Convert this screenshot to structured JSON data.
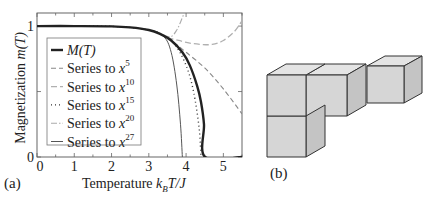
{
  "figure": {
    "panel_a_label": "(a)",
    "panel_b_label": "(b)"
  },
  "chart_data": [
    {
      "type": "line",
      "panel": "(a)",
      "title": "",
      "xlabel": "Temperature k_B T/J",
      "xlabel_parts": {
        "main": "Temperature ",
        "k": "k",
        "sub": "B",
        "rest": "T/J"
      },
      "ylabel": "Magnetization m(T)",
      "ylabel_parts": {
        "main": "Magnetization ",
        "func": "m",
        "arg": "(T)"
      },
      "xlim": [
        0,
        5.5
      ],
      "ylim": [
        0,
        1.1
      ],
      "xticks": [
        0,
        1,
        2,
        3,
        4,
        5
      ],
      "xtick_labels": [
        "0",
        "1",
        "2",
        "3",
        "4",
        "5"
      ],
      "yticks": [
        0,
        1
      ],
      "ytick_labels": [
        "0",
        "1"
      ],
      "grid": false,
      "legend_position": "inside-left",
      "series": [
        {
          "name": "M(T)",
          "legend": "M(T)",
          "style": "solid-thick",
          "color": "#222222",
          "x": [
            0,
            1,
            2,
            2.5,
            3,
            3.3,
            3.6,
            3.9,
            4.1,
            4.3,
            4.4,
            4.48,
            4.51,
            5.5
          ],
          "y": [
            1.0,
            1.0,
            0.998,
            0.99,
            0.97,
            0.94,
            0.89,
            0.8,
            0.7,
            0.54,
            0.42,
            0.25,
            0.0,
            0.0
          ]
        },
        {
          "name": "Series to x^5",
          "legend": "Series to x",
          "exp": "5",
          "style": "dashed",
          "color": "#888888",
          "x": [
            3.3,
            3.6,
            4.0,
            4.5,
            5.0,
            5.5
          ],
          "y": [
            0.94,
            0.89,
            0.8,
            0.68,
            0.52,
            0.33
          ]
        },
        {
          "name": "Series to x^10",
          "legend": "Series to x",
          "exp": "10",
          "style": "dashed-light",
          "color": "#b0b0b0",
          "x": [
            3.5,
            3.8,
            4.1,
            4.4,
            4.7,
            5.0,
            5.3,
            5.5
          ],
          "y": [
            0.91,
            0.89,
            0.87,
            0.86,
            0.86,
            0.89,
            0.96,
            1.04
          ]
        },
        {
          "name": "Series to x^15",
          "legend": "Series to x",
          "exp": "15",
          "style": "dotted",
          "color": "#333333",
          "x": [
            0,
            2,
            3,
            3.4,
            3.7,
            4.0,
            4.2,
            4.35,
            4.4
          ],
          "y": [
            1.0,
            0.998,
            0.97,
            0.93,
            0.86,
            0.7,
            0.5,
            0.22,
            0.0
          ]
        },
        {
          "name": "Series to x^20",
          "legend": "Series to x",
          "exp": "20",
          "style": "dash-dot",
          "color": "#aaaaaa",
          "x": [
            3.4,
            3.6,
            3.75,
            3.85,
            3.95
          ],
          "y": [
            0.93,
            0.92,
            0.97,
            1.03,
            1.1
          ]
        },
        {
          "name": "Series to x^27",
          "legend": "Series to x",
          "exp": "27",
          "style": "solid-thin",
          "color": "#555555",
          "x": [
            0,
            2,
            3,
            3.4,
            3.6,
            3.75,
            3.85,
            3.9
          ],
          "y": [
            1.0,
            0.998,
            0.97,
            0.92,
            0.8,
            0.55,
            0.25,
            0.0
          ]
        }
      ]
    },
    {
      "type": "diagram",
      "panel": "(b)",
      "description": "Polycube cluster of four unit cubes: two cubes side by side in the top row, one cube below the left cube, and one cube raised and set back to the right"
    }
  ]
}
